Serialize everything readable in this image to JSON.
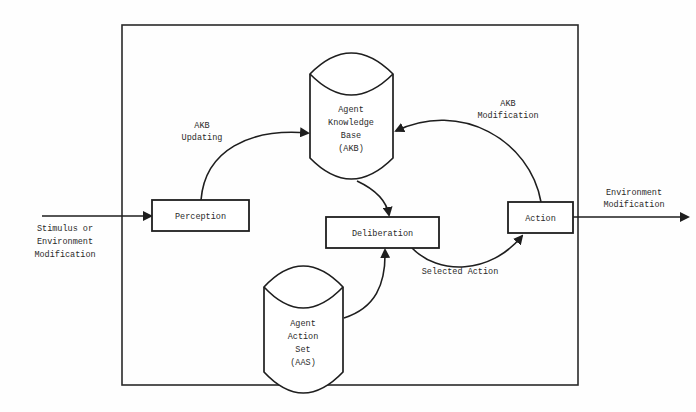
{
  "diagram": {
    "nodes": {
      "perception": {
        "label": "Perception",
        "shape": "rectangle"
      },
      "deliberation": {
        "label": "Deliberation",
        "shape": "rectangle"
      },
      "action": {
        "label": "Action",
        "shape": "rectangle"
      },
      "akb": {
        "label_lines": [
          "Agent",
          "Knowledge",
          "Base",
          "(AKB)"
        ],
        "shape": "cylinder"
      },
      "aas": {
        "label_lines": [
          "Agent",
          "Action",
          "Set",
          "(AAS)"
        ],
        "shape": "cylinder"
      }
    },
    "edges": {
      "input": {
        "label_lines": [
          "Stimulus or",
          "Environment",
          "Modification"
        ],
        "from": "external",
        "to": "perception"
      },
      "akb_updating": {
        "label_lines": [
          "AKB",
          "Updating"
        ],
        "from": "perception",
        "to": "akb"
      },
      "akb_to_deliberation": {
        "from": "akb",
        "to": "deliberation"
      },
      "aas_to_deliberation": {
        "from": "aas",
        "to": "deliberation"
      },
      "selected_action": {
        "label": "Selected Action",
        "from": "deliberation",
        "to": "action"
      },
      "akb_modification": {
        "label_lines": [
          "AKB",
          "Modification"
        ],
        "from": "action",
        "to": "akb"
      },
      "output": {
        "label_lines": [
          "Environment",
          "Modification"
        ],
        "from": "action",
        "to": "external"
      }
    },
    "colors": {
      "line": "#1e1e1e",
      "text": "#2a2a2a",
      "background": "#ffffff"
    }
  }
}
